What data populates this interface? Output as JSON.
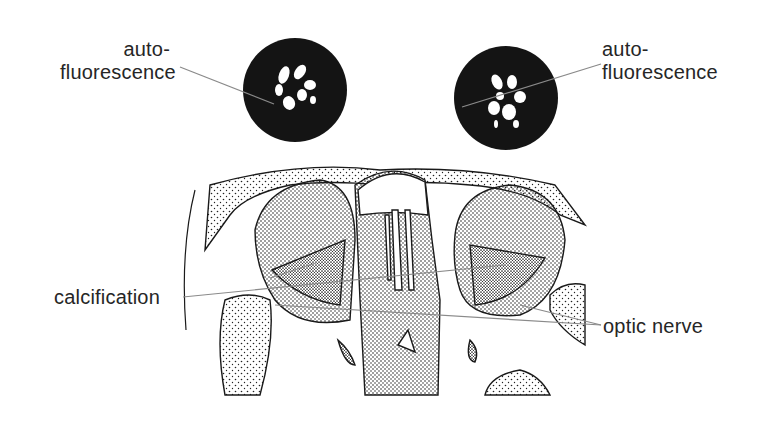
{
  "diagram": {
    "type": "anatomical illustration (axial section, orbits with optic nerves)",
    "labels": {
      "autofluorescence_left": {
        "line1": "auto-",
        "line2": "fluorescence"
      },
      "autofluorescence_right": {
        "line1": "auto-",
        "line2": "fluorescence"
      },
      "calcification": "calcification",
      "optic_nerve": "optic nerve"
    },
    "colors": {
      "ink": "#1a1a1a",
      "leader": "#8a8a8a",
      "text": "#262626",
      "background": "#ffffff"
    }
  }
}
